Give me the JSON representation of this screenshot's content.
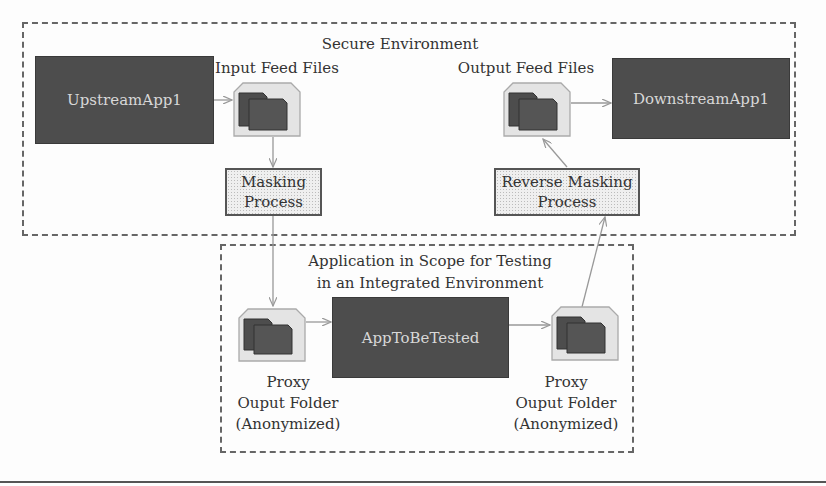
{
  "secure_environment": {
    "title": "Secure Environment",
    "upstream_app": "UpstreamApp1",
    "input_files_label": "Input Feed Files",
    "masking_process": [
      "Masking",
      "Process"
    ],
    "output_files_label": "Output Feed Files",
    "downstream_app": "DownstreamApp1",
    "reverse_masking_process": [
      "Reverse Masking",
      "Process"
    ]
  },
  "test_environment": {
    "title": [
      "Application in Scope for Testing",
      "in an Integrated Environment"
    ],
    "app_under_test": "AppToBeTested",
    "left_proxy_folder": [
      "Proxy",
      "Ouput Folder",
      "(Anonymized)"
    ],
    "right_proxy_folder": [
      "Proxy",
      "Ouput Folder",
      "(Anonymized)"
    ]
  },
  "icons": {
    "file_stack": "file-stack-icon"
  },
  "colors": {
    "app_box": "#4d4d4d",
    "app_text": "#d8d8d8",
    "dashed_border": "#666666",
    "arrow": "#999999",
    "process_fill": "#efefef"
  }
}
